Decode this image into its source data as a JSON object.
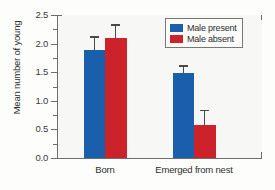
{
  "chart_data": {
    "type": "bar",
    "title": "",
    "xlabel": "",
    "ylabel": "Mean number of young",
    "categories": [
      "Born",
      "Emerged from nest"
    ],
    "series": [
      {
        "name": "Male present",
        "color": "#1a5fab",
        "values": [
          1.89,
          1.48
        ],
        "errors": [
          0.24,
          0.14
        ]
      },
      {
        "name": "Male absent",
        "color": "#cc2229",
        "values": [
          2.1,
          0.58
        ],
        "errors": [
          0.24,
          0.26
        ]
      }
    ],
    "ylim": [
      0.0,
      2.5
    ],
    "ytick_labels": [
      "0.0",
      "0.5",
      "1.0",
      "1.5",
      "2.0",
      "2.5"
    ],
    "ytick_values": [
      0.0,
      0.5,
      1.0,
      1.5,
      2.0,
      2.5
    ],
    "yminor_tick_values": [
      0.25,
      0.75,
      1.25,
      1.75,
      2.25
    ],
    "grid": false,
    "legend_position": "top-right",
    "error_bar_style": "upper-only-with-cap"
  },
  "legend": {
    "entries": [
      {
        "label": "Male present",
        "swatch": "legend-swatch-blue"
      },
      {
        "label": "Male absent",
        "swatch": "legend-swatch-red"
      }
    ]
  }
}
